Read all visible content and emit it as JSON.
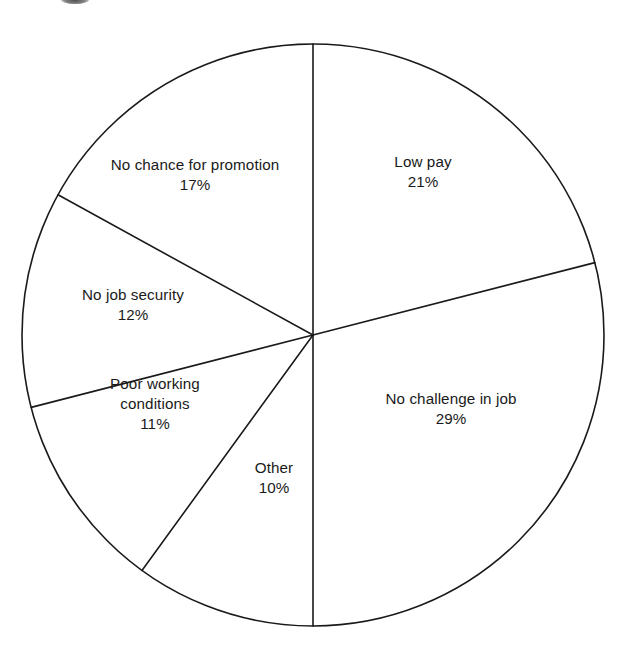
{
  "chart_data": {
    "type": "pie",
    "title": "",
    "subtitle": "",
    "xlabel": "",
    "ylabel": "",
    "legend_position": "none",
    "grid": false,
    "value_suffix": "%",
    "start_angle_deg": 0,
    "direction": "clockwise",
    "categories": [
      "Low pay",
      "No challenge in job",
      "Other",
      "Poor working conditions",
      "No job security",
      "No chance for promotion"
    ],
    "values": [
      21,
      29,
      10,
      11,
      12,
      17
    ],
    "slices": [
      {
        "label": "Low pay",
        "label_lines": [
          "Low pay"
        ],
        "value": 21,
        "value_text": "21%",
        "start_deg": 0,
        "end_deg": 75.6,
        "label_x": 423,
        "label_y": 172
      },
      {
        "label": "No challenge in job",
        "label_lines": [
          "No challenge in job"
        ],
        "value": 29,
        "value_text": "29%",
        "start_deg": 75.6,
        "end_deg": 180,
        "label_x": 451,
        "label_y": 409
      },
      {
        "label": "Other",
        "label_lines": [
          "Other"
        ],
        "value": 10,
        "value_text": "10%",
        "start_deg": 180,
        "end_deg": 216,
        "label_x": 274,
        "label_y": 478
      },
      {
        "label": "Poor working conditions",
        "label_lines": [
          "Poor working",
          "conditions"
        ],
        "value": 11,
        "value_text": "11%",
        "start_deg": 216,
        "end_deg": 255.6,
        "label_x": 155,
        "label_y": 404
      },
      {
        "label": "No job security",
        "label_lines": [
          "No job security"
        ],
        "value": 12,
        "value_text": "12%",
        "start_deg": 255.6,
        "end_deg": 298.8,
        "label_x": 133,
        "label_y": 305
      },
      {
        "label": "No chance for promotion",
        "label_lines": [
          "No chance for promotion"
        ],
        "value": 17,
        "value_text": "17%",
        "start_deg": 298.8,
        "end_deg": 360,
        "label_x": 195,
        "label_y": 175
      }
    ],
    "geometry": {
      "center_x": 313,
      "center_y": 335,
      "radius": 291
    },
    "style": {
      "stroke_color": "#1a1a1a",
      "fill_color": "#ffffff",
      "background_color": "#ffffff",
      "stroke_width": 1.6
    }
  }
}
